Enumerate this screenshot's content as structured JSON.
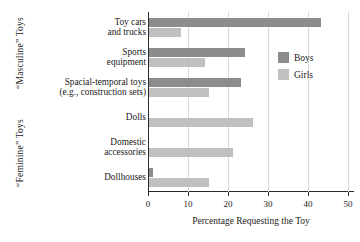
{
  "chart_data": {
    "type": "bar",
    "orientation": "horizontal",
    "title": "",
    "xlabel": "Percentage Requesting the Toy",
    "ylabel": "",
    "xlim": [
      0,
      50
    ],
    "xticks": [
      0,
      10,
      20,
      30,
      40,
      50
    ],
    "grid": true,
    "legend_position": "inside-right",
    "categories": [
      "Toy cars and trucks",
      "Sports equipment",
      "Spacial-temporal toys (e.g., construction sets)",
      "Dolls",
      "Domestic accessories",
      "Dollhouses"
    ],
    "series": [
      {
        "name": "Boys",
        "color": "#8c8c8c",
        "values": [
          43,
          24,
          23,
          0,
          0,
          1
        ]
      },
      {
        "name": "Girls",
        "color": "#c0c0c0",
        "values": [
          8,
          14,
          15,
          26,
          21,
          15
        ]
      }
    ],
    "group_labels": [
      {
        "text": "“Masculine” Toys",
        "categories": [
          0,
          1,
          2
        ]
      },
      {
        "text": "“Feminine” Toys",
        "categories": [
          3,
          4,
          5
        ]
      }
    ]
  },
  "category_lines": [
    [
      "Toy cars",
      "and trucks"
    ],
    [
      "Sports",
      "equipment"
    ],
    [
      "Spacial-temporal toys",
      "(e.g., construction sets)"
    ],
    [
      "Dolls"
    ],
    [
      "Domestic",
      "accessories"
    ],
    [
      "Dollhouses"
    ]
  ]
}
